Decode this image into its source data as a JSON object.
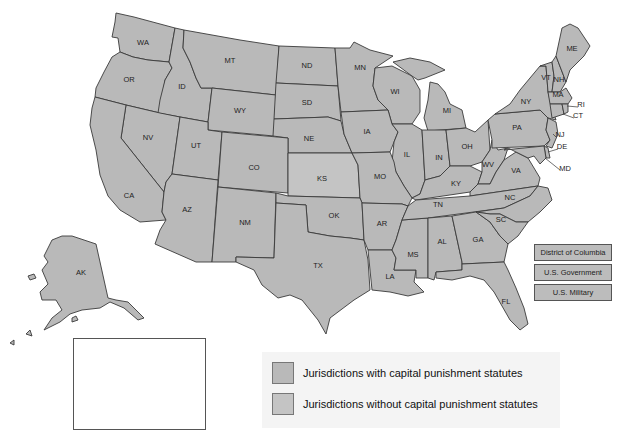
{
  "map": {
    "colors": {
      "with_statute": "#b9b9b9",
      "without_statute": "#c4c4c4",
      "border": "#3a3a3a"
    },
    "states": [
      {
        "abbr": "WA",
        "x": 143,
        "y": 45
      },
      {
        "abbr": "OR",
        "x": 129,
        "y": 82
      },
      {
        "abbr": "ID",
        "x": 182,
        "y": 89
      },
      {
        "abbr": "MT",
        "x": 230,
        "y": 63
      },
      {
        "abbr": "WY",
        "x": 240,
        "y": 113
      },
      {
        "abbr": "ND",
        "x": 307,
        "y": 68
      },
      {
        "abbr": "SD",
        "x": 307,
        "y": 105
      },
      {
        "abbr": "NE",
        "x": 309,
        "y": 141
      },
      {
        "abbr": "MN",
        "x": 360,
        "y": 70
      },
      {
        "abbr": "WI",
        "x": 395,
        "y": 94
      },
      {
        "abbr": "MI",
        "x": 447,
        "y": 113
      },
      {
        "abbr": "IA",
        "x": 367,
        "y": 134
      },
      {
        "abbr": "IL",
        "x": 407,
        "y": 157
      },
      {
        "abbr": "IN",
        "x": 439,
        "y": 160
      },
      {
        "abbr": "OH",
        "x": 467,
        "y": 149
      },
      {
        "abbr": "NV",
        "x": 148,
        "y": 140
      },
      {
        "abbr": "UT",
        "x": 196,
        "y": 148
      },
      {
        "abbr": "CO",
        "x": 254,
        "y": 170
      },
      {
        "abbr": "KS",
        "x": 322,
        "y": 181
      },
      {
        "abbr": "MO",
        "x": 380,
        "y": 179
      },
      {
        "abbr": "KY",
        "x": 456,
        "y": 186
      },
      {
        "abbr": "WV",
        "x": 488,
        "y": 167
      },
      {
        "abbr": "VA",
        "x": 516,
        "y": 173
      },
      {
        "abbr": "CA",
        "x": 129,
        "y": 198
      },
      {
        "abbr": "AZ",
        "x": 187,
        "y": 212
      },
      {
        "abbr": "NM",
        "x": 245,
        "y": 225
      },
      {
        "abbr": "OK",
        "x": 334,
        "y": 218
      },
      {
        "abbr": "AR",
        "x": 382,
        "y": 226
      },
      {
        "abbr": "TN",
        "x": 438,
        "y": 207
      },
      {
        "abbr": "NC",
        "x": 510,
        "y": 200
      },
      {
        "abbr": "SC",
        "x": 501,
        "y": 222
      },
      {
        "abbr": "MS",
        "x": 413,
        "y": 257
      },
      {
        "abbr": "AL",
        "x": 442,
        "y": 244
      },
      {
        "abbr": "GA",
        "x": 478,
        "y": 242
      },
      {
        "abbr": "LA",
        "x": 390,
        "y": 279
      },
      {
        "abbr": "TX",
        "x": 318,
        "y": 268
      },
      {
        "abbr": "FL",
        "x": 506,
        "y": 304
      },
      {
        "abbr": "PA",
        "x": 517,
        "y": 130
      },
      {
        "abbr": "NY",
        "x": 526,
        "y": 104
      },
      {
        "abbr": "VT",
        "x": 546,
        "y": 80
      },
      {
        "abbr": "NH",
        "x": 559,
        "y": 82
      },
      {
        "abbr": "ME",
        "x": 572,
        "y": 51
      },
      {
        "abbr": "MA",
        "x": 558,
        "y": 97
      },
      {
        "abbr": "RI",
        "x": 581,
        "y": 107
      },
      {
        "abbr": "CT",
        "x": 578,
        "y": 118
      },
      {
        "abbr": "NJ",
        "x": 560,
        "y": 137
      },
      {
        "abbr": "DE",
        "x": 562,
        "y": 149
      },
      {
        "abbr": "MD",
        "x": 565,
        "y": 171
      },
      {
        "abbr": "AK",
        "x": 81,
        "y": 275
      },
      {
        "abbr": "HI",
        "x": 163,
        "y": 354
      }
    ]
  },
  "side_boxes": [
    {
      "label": "District of Columbia"
    },
    {
      "label": "U.S. Government"
    },
    {
      "label": "U.S. Military"
    }
  ],
  "legend": {
    "items": [
      {
        "label": "Jurisdictions with capital punishment statutes",
        "color": "#b9b9b9"
      },
      {
        "label": "Jurisdictions without capital punishment statutes",
        "color": "#c4c4c4"
      }
    ]
  }
}
